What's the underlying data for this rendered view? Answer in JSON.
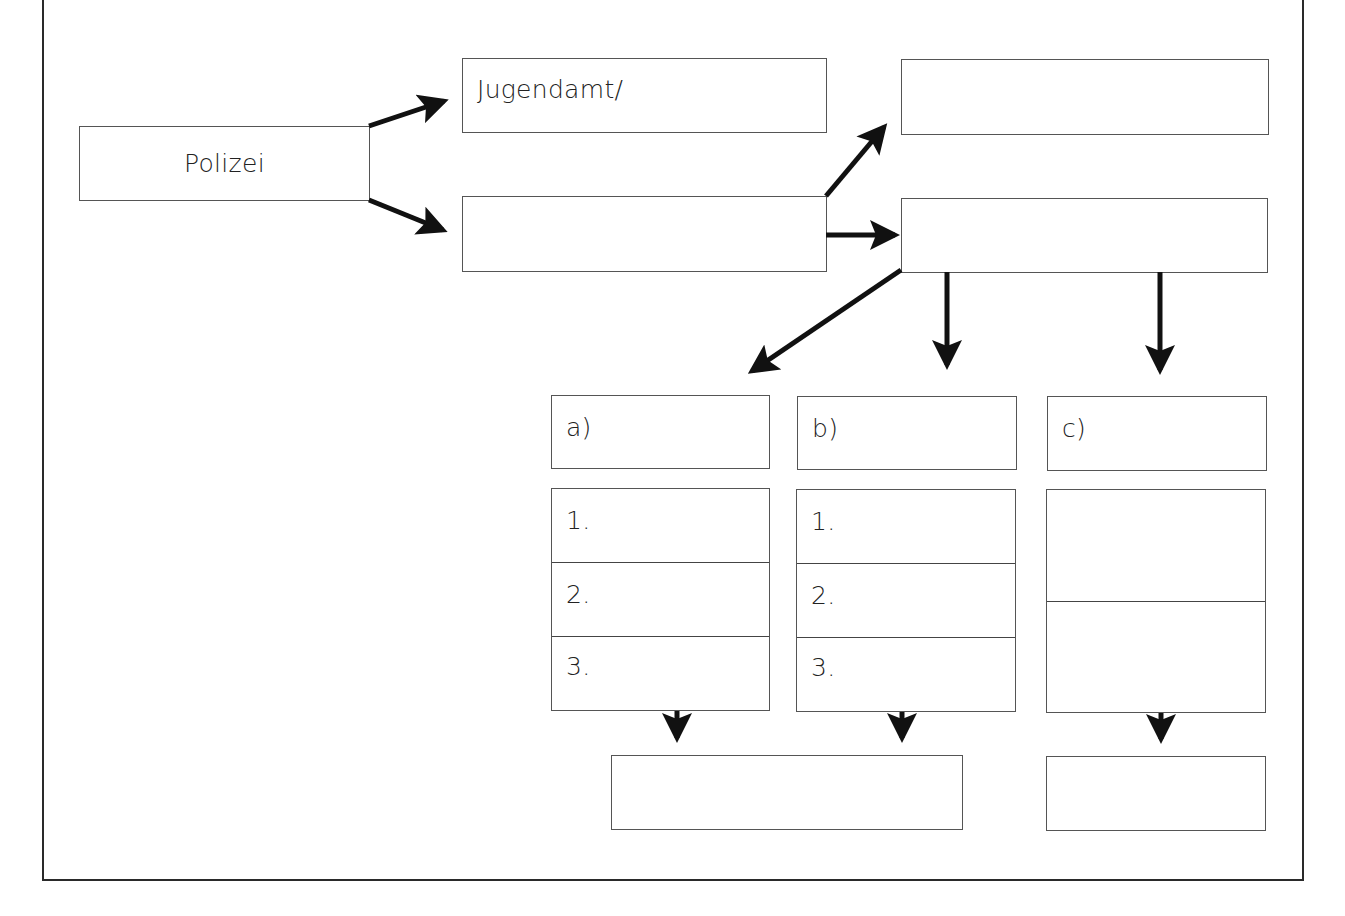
{
  "diagram": {
    "nodes": {
      "police": {
        "label": "Polizei"
      },
      "youth_office": {
        "label": "Jugendamt/"
      },
      "middle": {
        "label": ""
      },
      "top_right": {
        "label": ""
      },
      "mid_right": {
        "label": ""
      },
      "option_a": {
        "label": "a)"
      },
      "option_b": {
        "label": "b)"
      },
      "option_c": {
        "label": "c)"
      },
      "list_a": {
        "rows": [
          "1.",
          "2.",
          "3."
        ]
      },
      "list_b": {
        "rows": [
          "1.",
          "2.",
          "3."
        ]
      },
      "list_c": {
        "rows": [
          "",
          ""
        ]
      },
      "result_ab": {
        "label": ""
      },
      "result_c": {
        "label": ""
      }
    },
    "edges": [
      {
        "from": "police",
        "to": "youth_office"
      },
      {
        "from": "police",
        "to": "middle"
      },
      {
        "from": "middle",
        "to": "top_right"
      },
      {
        "from": "middle",
        "to": "mid_right"
      },
      {
        "from": "mid_right",
        "to": "option_a"
      },
      {
        "from": "mid_right",
        "to": "option_b"
      },
      {
        "from": "mid_right",
        "to": "option_c"
      },
      {
        "from": "list_a",
        "to": "result_ab"
      },
      {
        "from": "list_b",
        "to": "result_ab"
      },
      {
        "from": "list_c",
        "to": "result_c"
      }
    ],
    "colors": {
      "line": "#555555",
      "arrow": "#111111",
      "background": "#ffffff"
    }
  }
}
